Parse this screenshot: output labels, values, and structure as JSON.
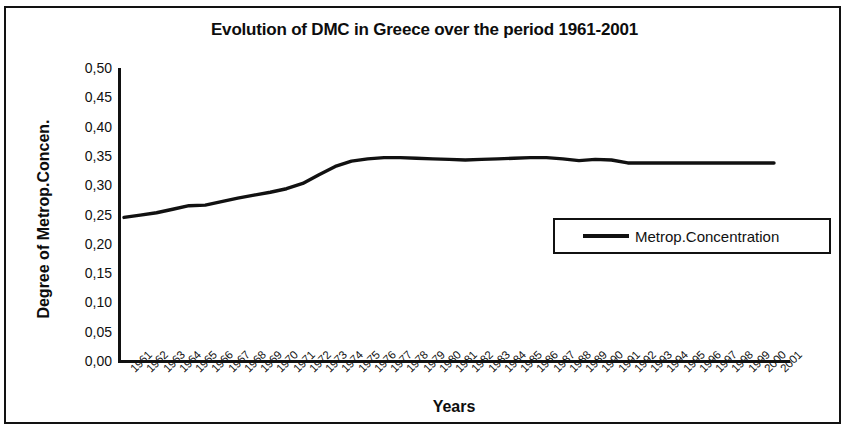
{
  "figure": {
    "title": "Evolution of DMC in Greece over the period 1961-2001",
    "x_axis_title": "Years",
    "y_axis_title": "Degree of Metrop.Concen.",
    "line_color": "#111111",
    "frame_color": "#121212",
    "background": "#ffffff"
  },
  "legend": {
    "position": "inside-right",
    "entries": [
      {
        "label": "Metrop.Concentration",
        "color": "#111111"
      }
    ]
  },
  "chart_data": {
    "type": "line",
    "title": "Evolution of DMC in Greece over the period 1961-2001",
    "xlabel": "Years",
    "ylabel": "Degree of Metrop.Concen.",
    "xlim": [
      1961,
      2001
    ],
    "ylim": [
      0.0,
      0.5
    ],
    "ytick_labels": [
      "0,50",
      "0,45",
      "0,40",
      "0,35",
      "0,30",
      "0,25",
      "0,20",
      "0,15",
      "0,10",
      "0,05",
      "0,00"
    ],
    "ytick_values": [
      0.5,
      0.45,
      0.4,
      0.35,
      0.3,
      0.25,
      0.2,
      0.15,
      0.1,
      0.05,
      0.0
    ],
    "grid": false,
    "legend_position": "inside-right",
    "categories": [
      "1961",
      "1962",
      "1963",
      "1964",
      "1965",
      "1966",
      "1967",
      "1968",
      "1969",
      "1970",
      "1971",
      "1972",
      "1973",
      "1974",
      "1975",
      "1976",
      "1977",
      "1978",
      "1979",
      "1980",
      "1981",
      "1982",
      "1983",
      "1984",
      "1985",
      "1986",
      "1987",
      "1988",
      "1989",
      "1990",
      "1991",
      "1992",
      "1993",
      "1994",
      "1995",
      "1996",
      "1997",
      "1998",
      "1999",
      "2000",
      "2001"
    ],
    "series": [
      {
        "name": "Metrop.Concentration",
        "color": "#111111",
        "values": [
          0.245,
          0.249,
          0.253,
          0.259,
          0.265,
          0.266,
          0.272,
          0.278,
          0.283,
          0.288,
          0.294,
          0.303,
          0.318,
          0.332,
          0.341,
          0.345,
          0.347,
          0.347,
          0.346,
          0.345,
          0.344,
          0.343,
          0.344,
          0.345,
          0.346,
          0.347,
          0.347,
          0.345,
          0.342,
          0.344,
          0.343,
          0.338,
          0.338,
          0.338,
          0.338,
          0.338,
          0.338,
          0.338,
          0.338,
          0.338,
          0.338
        ]
      }
    ]
  }
}
